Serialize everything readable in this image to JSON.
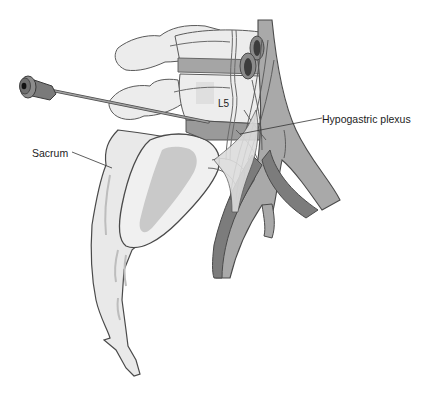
{
  "figure": {
    "labels": {
      "vertebra": "L5",
      "plexus": "Hypogastric plexus",
      "bone": "Sacrum"
    },
    "colors": {
      "background": "#ffffff",
      "bone_fill": "#e9e9e9",
      "bone_shadow": "#c9c9c9",
      "outline": "#4a4a4a",
      "muscle": "#9a9a9a",
      "vessel_dark": "#7c7c7c",
      "vessel_light": "#a9a9a9",
      "vessel_lumen": "#3c3c3c",
      "nerve": "#dcdcdc",
      "needle_hub": "#6e6e6e",
      "needle_shaft": "#8a8a8a"
    }
  }
}
